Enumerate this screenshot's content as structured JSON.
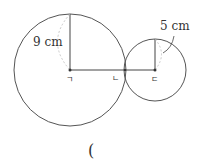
{
  "diagram": {
    "big_circle": {
      "radius_label": "9 cm"
    },
    "small_circle": {
      "radius_label": "5 cm"
    },
    "points": {
      "big_center": "ㄱ",
      "tangent": "ㄴ",
      "small_center": "ㄷ"
    },
    "answer_paren": "("
  }
}
